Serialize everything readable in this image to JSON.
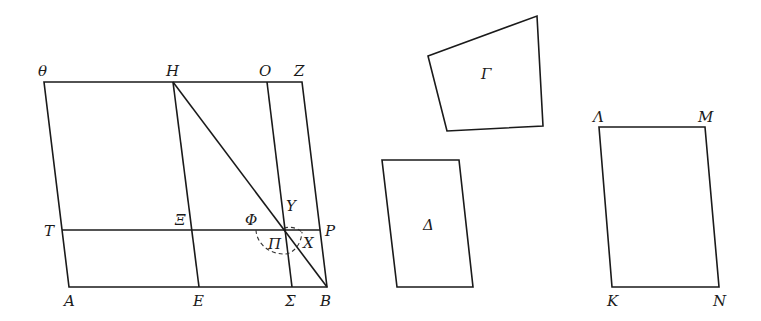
{
  "figure": {
    "main": {
      "labels": {
        "theta": "θ",
        "H": "H",
        "O": "O",
        "Z": "Z",
        "T": "T",
        "Xi": "Ξ",
        "Phi": "Φ",
        "Upsilon": "Υ",
        "P": "P",
        "Pi": "Π",
        "X": "X",
        "A": "A",
        "E": "E",
        "Sigma": "Σ",
        "B": "B"
      }
    },
    "gamma": {
      "label": "Γ"
    },
    "delta": {
      "label": "Δ"
    },
    "lambda_mnk": {
      "labels": {
        "Lambda": "Λ",
        "M": "M",
        "K": "K",
        "N": "N"
      }
    }
  }
}
